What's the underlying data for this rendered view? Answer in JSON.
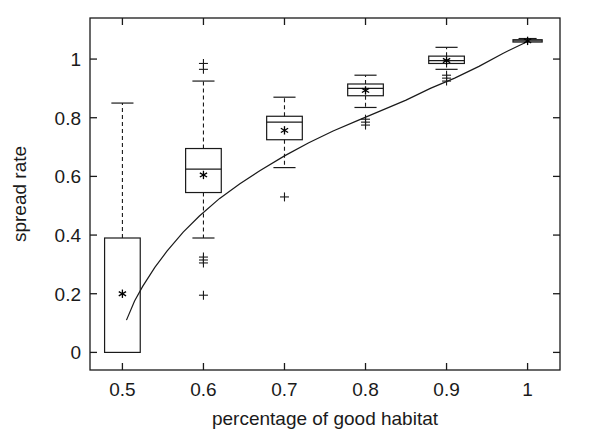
{
  "chart_data": {
    "type": "box",
    "title": "",
    "xlabel": "percentage of good habitat",
    "ylabel": "spread rate",
    "xlim": [
      0.46,
      1.04
    ],
    "ylim": [
      -0.06,
      1.14
    ],
    "xticks": [
      0.5,
      0.6,
      0.7,
      0.8,
      0.9,
      1
    ],
    "xticklabels": [
      "0.5",
      "0.6",
      "0.7",
      "0.8",
      "0.9",
      "1"
    ],
    "yticks": [
      0,
      0.2,
      0.4,
      0.6,
      0.8,
      1
    ],
    "yticklabels": [
      "0",
      "0.2",
      "0.4",
      "0.6",
      "0.8",
      "1"
    ],
    "grid": false,
    "legend": "none",
    "categories": [
      0.5,
      0.6,
      0.7,
      0.8,
      0.9,
      1
    ],
    "boxes": [
      {
        "x": 0.5,
        "whisker_low": 0.0,
        "q1": 0.0,
        "median": 0.0,
        "q3": 0.39,
        "whisker_high": 0.85,
        "mean": 0.2,
        "outliers": [],
        "box_halfwidth": 0.022,
        "has_low_cap": false
      },
      {
        "x": 0.6,
        "whisker_low": 0.39,
        "q1": 0.545,
        "median": 0.625,
        "q3": 0.695,
        "whisker_high": 0.925,
        "mean": 0.605,
        "outliers": [
          0.985,
          0.965,
          0.325,
          0.315,
          0.305,
          0.195
        ],
        "box_halfwidth": 0.022,
        "has_low_cap": true
      },
      {
        "x": 0.7,
        "whisker_low": 0.63,
        "q1": 0.725,
        "median": 0.785,
        "q3": 0.805,
        "whisker_high": 0.87,
        "mean": 0.757,
        "outliers": [
          0.53
        ],
        "box_halfwidth": 0.022,
        "has_low_cap": true
      },
      {
        "x": 0.8,
        "whisker_low": 0.835,
        "q1": 0.875,
        "median": 0.9,
        "q3": 0.915,
        "whisker_high": 0.945,
        "mean": 0.893,
        "outliers": [
          0.795,
          0.785,
          0.775
        ],
        "box_halfwidth": 0.022,
        "has_low_cap": true
      },
      {
        "x": 0.9,
        "whisker_low": 0.965,
        "q1": 0.985,
        "median": 0.995,
        "q3": 1.01,
        "whisker_high": 1.04,
        "mean": 0.995,
        "outliers": [
          0.945,
          0.935,
          0.925
        ],
        "box_halfwidth": 0.022,
        "has_low_cap": true
      },
      {
        "x": 1,
        "whisker_low": 1.055,
        "q1": 1.058,
        "median": 1.062,
        "q3": 1.066,
        "whisker_high": 1.07,
        "mean": 1.062,
        "outliers": [],
        "box_halfwidth": 0.018,
        "has_low_cap": false
      }
    ],
    "fit_curve": {
      "name": "model fit",
      "x": [
        0.505,
        0.515,
        0.525,
        0.54,
        0.555,
        0.575,
        0.595,
        0.62,
        0.645,
        0.67,
        0.7,
        0.73,
        0.76,
        0.79,
        0.82,
        0.85,
        0.88,
        0.91,
        0.94,
        0.97,
        1.0
      ],
      "y": [
        0.11,
        0.175,
        0.225,
        0.29,
        0.345,
        0.41,
        0.465,
        0.525,
        0.575,
        0.62,
        0.67,
        0.715,
        0.755,
        0.79,
        0.825,
        0.86,
        0.9,
        0.935,
        0.975,
        1.02,
        1.06
      ]
    }
  }
}
